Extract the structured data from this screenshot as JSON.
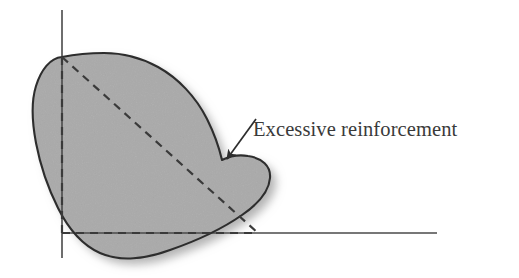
{
  "figure": {
    "kind": "technical-illustration",
    "background_color": "#ffffff",
    "annotations": [
      {
        "id": "excessive-reinforcement",
        "label": "Excessive reinforcement",
        "text_color": "#3a3a3a",
        "text_x": 253,
        "text_baseline_y": 136,
        "font_size_px": 20.5,
        "leader_from_x": 256,
        "leader_from_y": 119,
        "leader_to_x": 227,
        "leader_to_y": 159
      }
    ],
    "axes": {
      "line_color": "#4a4a4a",
      "vertical": {
        "x": 62,
        "y_top": 10,
        "y_bottom": 258
      },
      "horizontal": {
        "y": 233,
        "x_left": 62,
        "x_right": 437
      }
    },
    "weld_shape": {
      "fill_color": "#aaaaaa",
      "outline_color": "#2d2d2d",
      "shadow_color": "#9a9a9a",
      "apex_x": 62,
      "apex_y": 57,
      "leftmost_x": 33,
      "lowest_y": 258,
      "rightmost_x": 270,
      "notch_x": 227,
      "notch_y": 159
    },
    "construction_lines": {
      "style": "dashed",
      "color": "#3a3a3a",
      "dash_on_px": 8,
      "dash_off_px": 6,
      "vertical": {
        "x": 62,
        "y_top": 57,
        "y_bottom": 233
      },
      "horizontal": {
        "y": 233,
        "x_left": 62,
        "x_right": 258
      },
      "diagonal": {
        "x1": 62,
        "y1": 57,
        "x2": 258,
        "y2": 233
      }
    }
  }
}
